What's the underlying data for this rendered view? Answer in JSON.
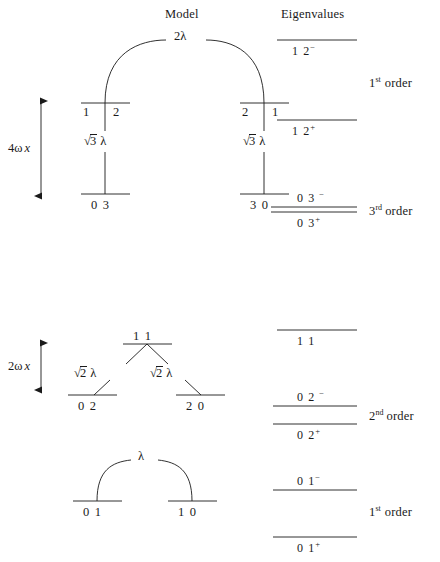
{
  "headers": {
    "model": "Model",
    "eigenvalues": "Eigenvalues"
  },
  "scales": [
    {
      "id": "scale-4wx",
      "prefix": "4",
      "omega": "ω",
      "var": "x"
    },
    {
      "id": "scale-2wx",
      "prefix": "2",
      "omega": "ω",
      "var": "x"
    }
  ],
  "model": {
    "polyad_n3": {
      "coupling_top": "2λ",
      "upper_levels": [
        {
          "left_digit": "1",
          "right_digit": "2"
        },
        {
          "left_digit": "2",
          "right_digit": "1"
        }
      ],
      "vertical_couplings": [
        {
          "radicand": "3",
          "lambda": "λ"
        },
        {
          "radicand": "3",
          "lambda": "λ"
        }
      ],
      "lower_levels": [
        "0 3",
        "3 0"
      ]
    },
    "polyad_n2": {
      "top_level_label": "1 1",
      "diagonal_couplings": [
        {
          "radicand": "2",
          "lambda": "λ"
        },
        {
          "radicand": "2",
          "lambda": "λ"
        }
      ],
      "lower_levels": [
        "0 2",
        "2 0"
      ]
    },
    "polyad_n1": {
      "coupling_top": "λ",
      "lower_levels": [
        "0 1",
        "1 0"
      ]
    }
  },
  "eigenvalues": {
    "levels": [
      {
        "id": "eig-12-minus",
        "base": "1 2",
        "sign": "−"
      },
      {
        "id": "eig-12-plus",
        "base": "1 2",
        "sign": "+"
      },
      {
        "id": "eig-03-minus",
        "base": "0 3",
        "sign": "−"
      },
      {
        "id": "eig-03-plus",
        "base": "0 3",
        "sign": "+"
      },
      {
        "id": "eig-11",
        "base": "1 1",
        "sign": ""
      },
      {
        "id": "eig-02-minus",
        "base": "0 2",
        "sign": "−"
      },
      {
        "id": "eig-02-plus",
        "base": "0 2",
        "sign": "+"
      },
      {
        "id": "eig-01-minus",
        "base": "0 1",
        "sign": "−"
      },
      {
        "id": "eig-01-plus",
        "base": "0 1",
        "sign": "+"
      }
    ],
    "orders": [
      {
        "id": "order-1st-top",
        "num": "1",
        "ord": "st",
        "word": "order"
      },
      {
        "id": "order-3rd",
        "num": "3",
        "ord": "rd",
        "word": "order"
      },
      {
        "id": "order-2nd",
        "num": "2",
        "ord": "nd",
        "word": "order"
      },
      {
        "id": "order-1st-bottom",
        "num": "1",
        "ord": "st",
        "word": "order"
      }
    ]
  },
  "caption": ""
}
